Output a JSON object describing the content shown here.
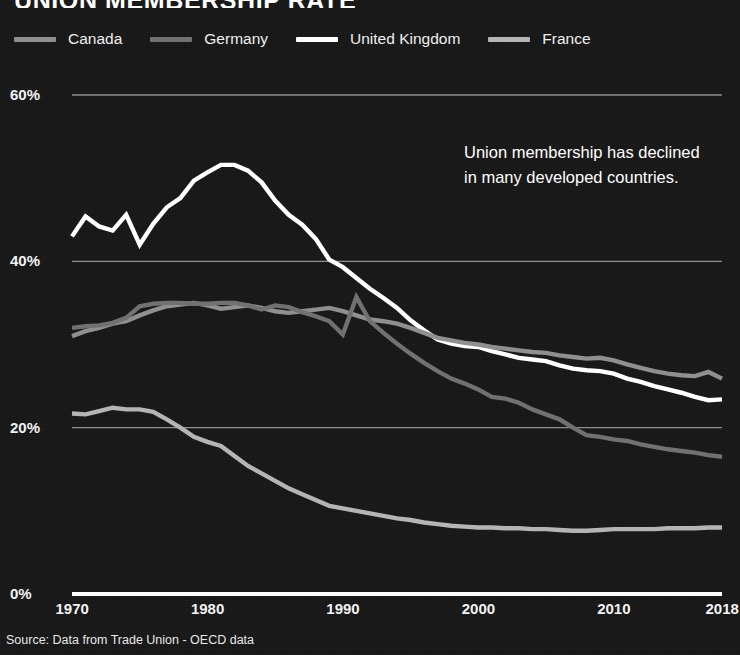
{
  "title": "UNION MEMBERSHIP RATE",
  "annotation": "Union membership has declined in many developed countries.",
  "source": "Source: Data from Trade Union - OECD data",
  "colors": {
    "background": "#161616",
    "axis": "#ffffff",
    "grid": "#8c8c8c",
    "canada": "#8e8e8e",
    "germany": "#6f6f6f",
    "united_kingdom": "#ffffff",
    "france": "#b4b4b4"
  },
  "legend": {
    "position": "top",
    "items": [
      {
        "label": "Canada",
        "color": "#8e8e8e"
      },
      {
        "label": "Germany",
        "color": "#6f6f6f"
      },
      {
        "label": "United Kingdom",
        "color": "#ffffff"
      },
      {
        "label": "France",
        "color": "#b4b4b4"
      }
    ]
  },
  "axes": {
    "y_ticks": [
      "60%",
      "40%",
      "20%",
      "0%"
    ],
    "x_ticks": [
      "1970",
      "1980",
      "1990",
      "2000",
      "2010",
      "2018"
    ]
  },
  "chart_data": {
    "type": "line",
    "title": "UNION MEMBERSHIP RATE",
    "xlabel": "",
    "ylabel": "",
    "xlim": [
      1970,
      2018
    ],
    "ylim": [
      0,
      60
    ],
    "grid": true,
    "legend_position": "top",
    "annotations": [
      "Union membership has declined in many developed countries."
    ],
    "x": [
      1970,
      1971,
      1972,
      1973,
      1974,
      1975,
      1976,
      1977,
      1978,
      1979,
      1980,
      1981,
      1982,
      1983,
      1984,
      1985,
      1986,
      1987,
      1988,
      1989,
      1990,
      1991,
      1992,
      1993,
      1994,
      1995,
      1996,
      1997,
      1998,
      1999,
      2000,
      2001,
      2002,
      2003,
      2004,
      2005,
      2006,
      2007,
      2008,
      2009,
      2010,
      2011,
      2012,
      2013,
      2014,
      2015,
      2016,
      2017,
      2018
    ],
    "series": [
      {
        "name": "United Kingdom",
        "color": "#ffffff",
        "values": [
          43.0,
          45.4,
          44.2,
          43.7,
          45.6,
          42.0,
          44.5,
          46.5,
          47.6,
          49.7,
          50.7,
          51.6,
          51.6,
          50.9,
          49.5,
          47.3,
          45.6,
          44.4,
          42.7,
          40.2,
          39.3,
          38.0,
          36.7,
          35.6,
          34.4,
          32.9,
          31.7,
          30.6,
          30.1,
          29.8,
          29.7,
          29.2,
          28.8,
          28.4,
          28.2,
          28.0,
          27.5,
          27.1,
          26.9,
          26.8,
          26.5,
          25.9,
          25.5,
          25.0,
          24.6,
          24.2,
          23.7,
          23.3,
          23.4
        ]
      },
      {
        "name": "Canada",
        "color": "#8e8e8e",
        "values": [
          31.0,
          31.6,
          32.0,
          32.5,
          32.8,
          33.5,
          34.1,
          34.6,
          34.8,
          35.0,
          34.7,
          34.3,
          34.5,
          34.7,
          34.4,
          34.0,
          33.8,
          34.0,
          34.2,
          34.4,
          34.0,
          33.5,
          33.0,
          32.8,
          32.5,
          32.0,
          31.4,
          30.8,
          30.5,
          30.2,
          30.0,
          29.7,
          29.5,
          29.3,
          29.1,
          29.0,
          28.7,
          28.5,
          28.3,
          28.4,
          28.1,
          27.6,
          27.2,
          26.8,
          26.5,
          26.3,
          26.2,
          26.7,
          25.9
        ]
      },
      {
        "name": "Germany",
        "color": "#6f6f6f",
        "values": [
          32.0,
          32.2,
          32.3,
          32.6,
          33.2,
          34.6,
          34.9,
          35.0,
          35.0,
          34.9,
          34.9,
          35.0,
          35.0,
          34.7,
          34.2,
          34.7,
          34.5,
          33.9,
          33.4,
          32.8,
          31.2,
          35.7,
          32.8,
          31.4,
          30.1,
          28.9,
          27.8,
          26.8,
          25.9,
          25.3,
          24.6,
          23.7,
          23.5,
          23.0,
          22.2,
          21.6,
          21.0,
          20.0,
          19.1,
          18.9,
          18.6,
          18.4,
          18.0,
          17.7,
          17.4,
          17.2,
          17.0,
          16.7,
          16.5
        ]
      },
      {
        "name": "France",
        "color": "#b4b4b4",
        "values": [
          21.7,
          21.6,
          22.0,
          22.4,
          22.2,
          22.2,
          21.9,
          21.0,
          20.0,
          18.9,
          18.3,
          17.8,
          16.6,
          15.4,
          14.5,
          13.6,
          12.7,
          12.0,
          11.3,
          10.6,
          10.3,
          10.0,
          9.7,
          9.4,
          9.1,
          8.9,
          8.6,
          8.4,
          8.2,
          8.1,
          8.0,
          8.0,
          7.9,
          7.9,
          7.8,
          7.8,
          7.7,
          7.6,
          7.6,
          7.7,
          7.8,
          7.8,
          7.8,
          7.8,
          7.9,
          7.9,
          7.9,
          8.0,
          8.0
        ]
      }
    ]
  }
}
